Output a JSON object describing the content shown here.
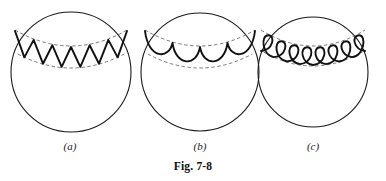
{
  "figure": {
    "caption": "Fig. 7-8",
    "background_color": "#ffffff",
    "stroke_color": "#1a1a1a",
    "wave_color": "#111111",
    "dashed_color": "#555555",
    "panels": [
      {
        "id": "a",
        "label": "(a)",
        "wave_type": "zigzag",
        "wave_name": "sawtooth-zigzag-wave",
        "description": "circle with zigzag (triangular) wave in band near top",
        "cycles": 6,
        "circle": {
          "cx": 71,
          "cy": 72,
          "r": 60
        },
        "band": {
          "upper_arc_y": 30,
          "lower_arc_y": 54,
          "half_width": 56
        }
      },
      {
        "id": "b",
        "label": "(b)",
        "wave_type": "scallop",
        "wave_name": "scalloped-arc-wave",
        "description": "circle with scalloped semicircular arcs in band near top",
        "cycles": 4,
        "circle": {
          "cx": 200,
          "cy": 72,
          "r": 59
        },
        "band": {
          "upper_arc_y": 30,
          "lower_arc_y": 54,
          "half_width": 55
        }
      },
      {
        "id": "c",
        "label": "(c)",
        "wave_type": "loops",
        "wave_name": "coiled-loop-wave",
        "description": "circle with coiled loop (spring) pattern in band near top",
        "cycles": 8,
        "circle": {
          "cx": 313,
          "cy": 72,
          "r": 55
        },
        "band": {
          "upper_arc_y": 30,
          "lower_arc_y": 52,
          "half_width": 52
        }
      }
    ]
  },
  "chart_data": {
    "type": "diagram",
    "title": "Fig. 7-8",
    "panel_count": 3,
    "panel_labels": [
      "(a)",
      "(b)",
      "(c)"
    ],
    "series": [
      {
        "name": "(a) zigzag wave",
        "wave_type": "zigzag",
        "cycles": 6
      },
      {
        "name": "(b) scalloped arcs",
        "wave_type": "scallop",
        "cycles": 4
      },
      {
        "name": "(c) coiled loops",
        "wave_type": "loops",
        "cycles": 8
      }
    ]
  }
}
